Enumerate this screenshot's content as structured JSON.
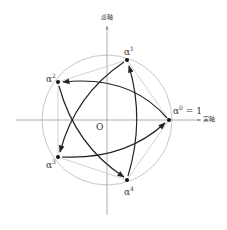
{
  "diagram": {
    "axes": {
      "real_label": "実軸",
      "imag_label": "虚軸",
      "origin_label": "O"
    },
    "points": [
      {
        "base": "α",
        "exp": "0",
        "suffix": " = 1"
      },
      {
        "base": "α",
        "exp": "1",
        "suffix": ""
      },
      {
        "base": "α",
        "exp": "2",
        "suffix": ""
      },
      {
        "base": "α",
        "exp": "3",
        "suffix": ""
      },
      {
        "base": "α",
        "exp": "4",
        "suffix": ""
      }
    ],
    "arrows": [
      "α0→α2",
      "α2→α4",
      "α4→α1",
      "α1→α3",
      "α3→α0"
    ],
    "colors": {
      "circle": "#c8c8c8",
      "axis": "#999999",
      "arrow": "#222222",
      "pentagon": "#c8c8c8"
    }
  }
}
